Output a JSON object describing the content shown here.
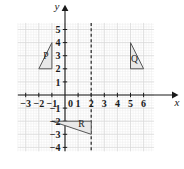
{
  "chart_data": {
    "type": "scatter",
    "title": "",
    "xlabel": "x",
    "ylabel": "y",
    "grid": true,
    "minor_grid": true,
    "legend": "none",
    "xlim": [
      -3.6,
      6.8
    ],
    "ylim": [
      -4.3,
      5.5
    ],
    "x_ticks": [
      -3,
      -2,
      -1,
      0,
      1,
      2,
      3,
      4,
      5,
      6
    ],
    "x_tick_labels": [
      "−3",
      "−2",
      "−1",
      "0",
      "1",
      "2",
      "3",
      "4",
      "5",
      "6"
    ],
    "y_ticks": [
      -4,
      -3,
      -2,
      -1,
      1,
      2,
      3,
      4,
      5
    ],
    "y_tick_labels": [
      "−4",
      "−3",
      "−2",
      "−1",
      "1",
      "2",
      "3",
      "4",
      "5"
    ],
    "origin_label": "0",
    "annotations": [
      {
        "name": "triangle-p",
        "label": "P",
        "vertices": [
          [
            -1,
            4
          ],
          [
            -1,
            2
          ],
          [
            -2,
            2
          ]
        ],
        "label_position": [
          -1.45,
          2.75
        ],
        "fill": "#e8e8e8",
        "stroke": "#555555"
      },
      {
        "name": "triangle-q",
        "label": "Q",
        "vertices": [
          [
            5,
            4
          ],
          [
            6,
            2
          ],
          [
            5,
            2
          ]
        ],
        "label_position": [
          5.3,
          2.55
        ],
        "fill": "#e8e8e8",
        "stroke": "#555555"
      },
      {
        "name": "triangle-r",
        "label": "R",
        "vertices": [
          [
            -1,
            -2
          ],
          [
            2,
            -2
          ],
          [
            2,
            -3
          ]
        ],
        "label_position": [
          1.25,
          -2.45
        ],
        "fill": "#e8e8e8",
        "stroke": "#555555"
      }
    ],
    "reference_lines": [
      {
        "name": "mirror-line",
        "orientation": "vertical",
        "x": 2,
        "style": "dashed",
        "color": "#333333"
      }
    ]
  },
  "colors": {
    "axis": "#1a1a1a",
    "major_grid": "#d8d8d8",
    "minor_grid": "#ededed",
    "shape_fill": "#e8e8e8",
    "shape_stroke": "#555555",
    "dashed_line": "#333333",
    "background": "#ffffff"
  },
  "labels": {
    "x_axis": "x",
    "y_axis": "y",
    "p": "P",
    "q": "Q",
    "r": "R"
  }
}
